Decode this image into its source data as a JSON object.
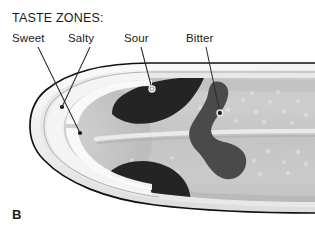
{
  "figure": {
    "panel_letter": "B",
    "heading": "TASTE ZONES:"
  },
  "labels": [
    {
      "id": "sweet",
      "text": "Sweet"
    },
    {
      "id": "salty",
      "text": "Salty"
    },
    {
      "id": "sour",
      "text": "Sour"
    },
    {
      "id": "bitter",
      "text": "Bitter"
    }
  ],
  "colors": {
    "background": "#ffffff",
    "outline": "#111111",
    "rim_white": "#f2f2f2",
    "rim_pale": "#e2e2e2",
    "surface_light": "#cfcfcf",
    "surface_mid": "#c2c2c2",
    "surface_shadow": "#b4b4b4",
    "zone_sour_dark": "#242424",
    "zone_bitter_gray": "#4a4a4a",
    "leader_line": "#2b2b2b",
    "text": "#1a1a1a"
  }
}
